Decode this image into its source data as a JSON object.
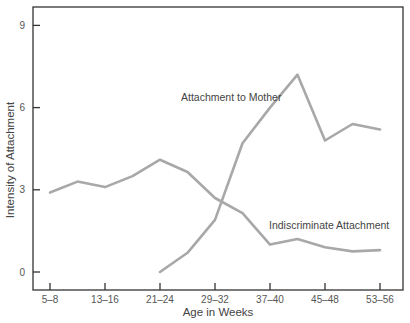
{
  "chart_data": {
    "type": "line",
    "title": "",
    "xlabel": "Age in Weeks",
    "ylabel": "Intensity of Attachment",
    "ylim": [
      -0.9,
      9.5
    ],
    "yticks": [
      0,
      3,
      6,
      9
    ],
    "grid": false,
    "legend": "none (inline annotations)",
    "x_tick_labels": [
      "5–8",
      "13–16",
      "21–24",
      "29–32",
      "37–40",
      "45–48",
      "53–56"
    ],
    "x": [
      "5–8",
      "9–12",
      "13–16",
      "17–20",
      "21–24",
      "25–28",
      "29–32",
      "33–36",
      "37–40",
      "41–44",
      "45–48",
      "49–52",
      "53–56"
    ],
    "series": [
      {
        "name": "Attachment to Mother",
        "values": [
          null,
          null,
          null,
          null,
          0.0,
          0.7,
          1.9,
          4.7,
          6.0,
          7.2,
          4.8,
          5.4,
          5.2
        ]
      },
      {
        "name": "Indiscriminate Attachment",
        "values": [
          2.9,
          3.3,
          3.1,
          3.5,
          4.1,
          3.65,
          2.7,
          2.15,
          1.0,
          1.2,
          0.9,
          0.75,
          0.8
        ]
      }
    ],
    "annotations": [
      {
        "text": "Attachment to Mother",
        "near_x": "29–32",
        "near_y": 5.95
      },
      {
        "text": "Indiscriminate Attachment",
        "near_x": "45–48",
        "near_y": 1.75
      }
    ],
    "line_color": "#a8a8a8",
    "axis_color": "#333333"
  }
}
